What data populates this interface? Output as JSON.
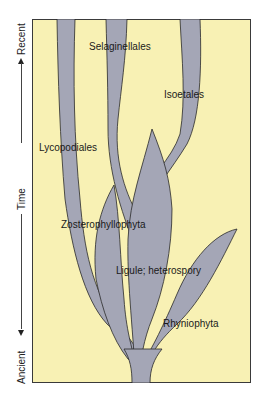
{
  "axis": {
    "label_top": "Recent",
    "label_middle": "Time",
    "label_bottom": "Ancient"
  },
  "diagram": {
    "background_color": "#f8f1b4",
    "lineage_color": "#a4a6b6",
    "outline_color": "#2a2a2a",
    "labels": {
      "selaginellales": "Selaginellales",
      "isoetales": "Isoetales",
      "lycopodiales": "Lycopodiales",
      "zosterophyllophyta": "Zosterophyllophyta",
      "ligule": "Ligule; heterospory",
      "rhyniophyta": "Rhyniophyta"
    }
  }
}
